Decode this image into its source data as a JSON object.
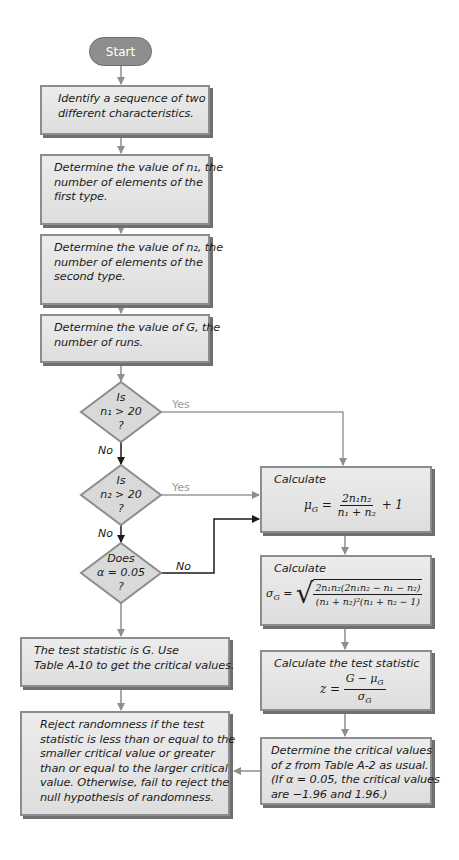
{
  "flowchart": {
    "start": "Start",
    "steps": {
      "identify": [
        "Identify a sequence of two",
        "different characteristics."
      ],
      "n1": [
        "Determine the value of n₁, the",
        "number of elements of the",
        "first type."
      ],
      "n2": [
        "Determine the value of n₂, the",
        "number of elements of the",
        "second type."
      ],
      "G": [
        "Determine the value of G, the",
        "number of runs."
      ],
      "test_stat_G": [
        "The test statistic is G. Use",
        "Table A-10 to get the critical values."
      ],
      "reject": [
        "Reject  randomness if the test",
        "statistic is less than or equal to the",
        "smaller critical value or greater",
        "than or equal to the larger critical",
        "value. Otherwise, fail to reject the",
        "null hypothesis of randomness."
      ],
      "calc_mu_label": "Calculate",
      "calc_sigma_label": "Calculate",
      "calc_z_label": "Calculate the test statistic",
      "critical": [
        "Determine the critical values",
        "of z from Table A-2 as usual.",
        "(If α = 0.05, the critical values",
        "are −1.96 and 1.96.)"
      ]
    },
    "decisions": {
      "d1": [
        "Is",
        "n₁ > 20",
        "?"
      ],
      "d2": [
        "Is",
        "n₂ > 20",
        "?"
      ],
      "d3": [
        "Does",
        "α = 0.05",
        "?"
      ]
    },
    "branch_labels": {
      "yes": "Yes",
      "no": "No"
    },
    "formulas": {
      "mu": {
        "lhs": "μ",
        "lhs_sub": "G",
        "num": "2n₁n₂",
        "den": "n₁ + n₂",
        "tail": "+ 1"
      },
      "sigma": {
        "lhs": "σ",
        "lhs_sub": "G",
        "num": "2n₁n₂(2n₁n₂ − n₁ − n₂)",
        "den": "(n₁ + n₂)²(n₁ + n₂ − 1)"
      },
      "z": {
        "lhs": "z",
        "num": "G − μ",
        "num_sub": "G",
        "den": "σ",
        "den_sub": "G"
      }
    },
    "colors": {
      "box_fill": "#e4e4e4",
      "box_border": "#8d8d8d",
      "start_fill": "#8e8e8e",
      "yes_arrow": "#9a9a9a",
      "no_arrow": "#1b1b1b"
    }
  }
}
